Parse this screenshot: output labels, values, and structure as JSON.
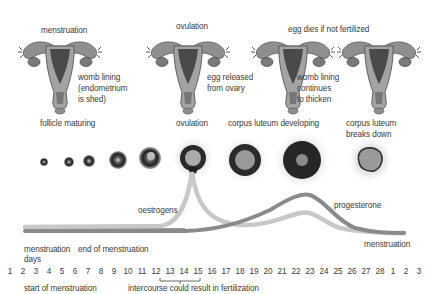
{
  "top_labels": {
    "menstruation": "menstruation",
    "ovulation": "ovulation",
    "egg_dies": "egg dies if not fertilized"
  },
  "uterus_labels": {
    "womb_lining_shed": [
      "womb lining",
      "(endometrium",
      "is shed)"
    ],
    "egg_released": [
      "egg released",
      "from ovary"
    ],
    "womb_lining_thicken": [
      "womb lining",
      "continues",
      "to thicken"
    ]
  },
  "follicle_labels": {
    "follicle_maturing": "follicle maturing",
    "ovulation": "ovulation",
    "corpus_luteum_developing": "corpus luteum developing",
    "corpus_luteum_breaks_down": [
      "corpus luteum",
      "breaks down"
    ]
  },
  "hormone_labels": {
    "oestrogens": "oestrogens",
    "progesterone": "progesterone"
  },
  "timeline_labels": {
    "menstruation_left": "menstruation",
    "end_of_menstruation": "end of menstruation",
    "days": "days",
    "menstruation_right": "menstruation",
    "start_of_menstruation": "start of menstruation",
    "intercourse": "intercourse could result in fertilization"
  },
  "days": [
    "1",
    "2",
    "3",
    "4",
    "5",
    "6",
    "7",
    "8",
    "9",
    "10",
    "11",
    "12",
    "13",
    "14",
    "15",
    "16",
    "17",
    "18",
    "19",
    "20",
    "21",
    "22",
    "23",
    "24",
    "25",
    "26",
    "27",
    "28",
    "1",
    "2",
    "3"
  ],
  "colors": {
    "oestrogen_curve": "#c8c8c8",
    "progesterone_curve": "#8a8a8a",
    "menstruation_band": "#9a9a9a",
    "text": "#3a3a3a",
    "follicle_dark": "#2a2a2a",
    "uterus_fill": "#8f8f8f"
  }
}
